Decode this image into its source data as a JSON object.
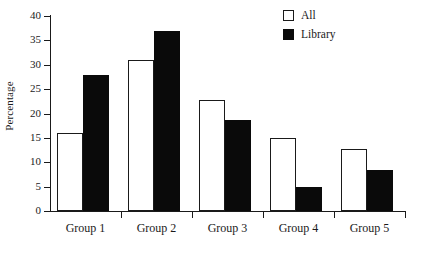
{
  "chart_data": {
    "type": "bar",
    "title": "",
    "subtitle": "",
    "xlabel": "",
    "ylabel": "Percentage",
    "categories": [
      "Group 1",
      "Group 2",
      "Group 3",
      "Group 4",
      "Group 5"
    ],
    "series": [
      {
        "name": "All",
        "color": "#ffffff",
        "edge_color": "#1a1a1a",
        "values": [
          16,
          31,
          22.7,
          15,
          12.7
        ]
      },
      {
        "name": "Library",
        "color": "#0a0a0a",
        "edge_color": "#0a0a0a",
        "values": [
          28,
          37,
          18.6,
          5,
          8.5
        ]
      }
    ],
    "ylim": [
      0,
      40
    ],
    "ytick_labels": [
      "0",
      "5",
      "10",
      "15",
      "20",
      "25",
      "30",
      "35",
      "40"
    ],
    "ytick_values": [
      0,
      5,
      10,
      15,
      20,
      25,
      30,
      35,
      40
    ],
    "grid": false,
    "legend_position": "top-right",
    "legend_entries": [
      {
        "label": "All",
        "swatch": "hollow-square-swatch"
      },
      {
        "label": "Library",
        "swatch": "filled-square-swatch"
      }
    ]
  },
  "axes": {
    "y_axis_title": "Percentage"
  }
}
